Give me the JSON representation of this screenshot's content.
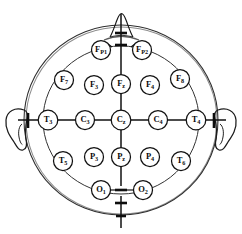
{
  "diagram": {
    "view": "superior (top-down) view of head",
    "style": "monochrome line drawing",
    "colors": {
      "background": "#ffffff",
      "line": "#111111",
      "head_outline": "#2e2e2e",
      "label_text": "#0a0a0a"
    },
    "anatomy": {
      "nose_label": "nose",
      "left_ear_label": "left ear",
      "right_ear_label": "right ear",
      "nasion_label": "nasion",
      "inion_label": "inion"
    },
    "electrodes": [
      {
        "id": "Fp1",
        "letter": "F",
        "sub": "P1",
        "x": 101,
        "y": 50,
        "r": 9.5
      },
      {
        "id": "Fp2",
        "letter": "F",
        "sub": "P2",
        "x": 142,
        "y": 50,
        "r": 9.5
      },
      {
        "id": "F7",
        "letter": "F",
        "sub": "7",
        "x": 64,
        "y": 80,
        "r": 9.5
      },
      {
        "id": "F3",
        "letter": "F",
        "sub": "3",
        "x": 94,
        "y": 85,
        "r": 9.5
      },
      {
        "id": "Fz",
        "letter": "F",
        "sub": "z",
        "x": 121,
        "y": 84,
        "r": 9.5
      },
      {
        "id": "F4",
        "letter": "F",
        "sub": "4",
        "x": 150,
        "y": 85,
        "r": 9.5
      },
      {
        "id": "F8",
        "letter": "F",
        "sub": "8",
        "x": 180,
        "y": 79,
        "r": 9.5
      },
      {
        "id": "T3",
        "letter": "T",
        "sub": "3",
        "x": 48,
        "y": 120,
        "r": 9.8
      },
      {
        "id": "C3",
        "letter": "C",
        "sub": "3",
        "x": 85,
        "y": 120,
        "r": 9.5
      },
      {
        "id": "Cz",
        "letter": "C",
        "sub": "z",
        "x": 121,
        "y": 120,
        "r": 9.8
      },
      {
        "id": "C4",
        "letter": "C",
        "sub": "4",
        "x": 158,
        "y": 120,
        "r": 9.5
      },
      {
        "id": "T4",
        "letter": "T",
        "sub": "4",
        "x": 196,
        "y": 120,
        "r": 9.8
      },
      {
        "id": "T5",
        "letter": "T",
        "sub": "5",
        "x": 63,
        "y": 161,
        "r": 9.5
      },
      {
        "id": "P3",
        "letter": "P",
        "sub": "3",
        "x": 94,
        "y": 157,
        "r": 9.5
      },
      {
        "id": "Pz",
        "letter": "P",
        "sub": "z",
        "x": 121,
        "y": 157,
        "r": 9.5
      },
      {
        "id": "P4",
        "letter": "P",
        "sub": "4",
        "x": 150,
        "y": 157,
        "r": 9.5
      },
      {
        "id": "T6",
        "letter": "T",
        "sub": "6",
        "x": 181,
        "y": 161,
        "r": 9.5
      },
      {
        "id": "O1",
        "letter": "O",
        "sub": "1",
        "x": 101,
        "y": 190,
        "r": 9.5
      },
      {
        "id": "O2",
        "letter": "O",
        "sub": "2",
        "x": 143,
        "y": 190,
        "r": 9.5
      }
    ],
    "axes": {
      "vertical_label": "anterior-posterior midline",
      "horizontal_label": "left-right coronal line",
      "tick_count": 6
    }
  }
}
